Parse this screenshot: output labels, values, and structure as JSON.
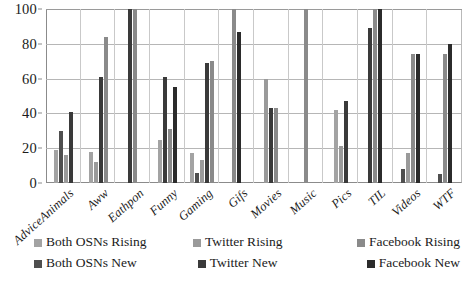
{
  "chart_data": {
    "type": "bar",
    "title": "",
    "subtitle": "",
    "xlabel": "",
    "ylabel": "",
    "ylim": [
      0,
      100
    ],
    "yticks": [
      0,
      20,
      40,
      60,
      80,
      100
    ],
    "grid": true,
    "legend_position": "bottom",
    "categories": [
      "AdviceAnimals",
      "Aww",
      "Eathpon",
      "Funny",
      "Gaming",
      "Gifs",
      "Movies",
      "Music",
      "Pics",
      "TIL",
      "Videos",
      "WTF"
    ],
    "series": [
      {
        "name": "Both OSNs Rising",
        "color": "#a3a3a3",
        "values": [
          19,
          18,
          0,
          25,
          17,
          0,
          0,
          0,
          42,
          0,
          0,
          0
        ]
      },
      {
        "name": "Both OSNs New",
        "color": "#4f4f4f",
        "values": [
          30,
          0,
          0,
          0,
          6,
          0,
          0,
          0,
          0,
          0,
          8,
          5
        ]
      },
      {
        "name": "Twitter Rising",
        "color": "#9a9a9a",
        "values": [
          16,
          12,
          0,
          0,
          13,
          0,
          60,
          0,
          21,
          0,
          17,
          0
        ]
      },
      {
        "name": "Twitter New",
        "color": "#3a3a3a",
        "values": [
          41,
          61,
          100,
          61,
          69,
          0,
          43,
          0,
          47,
          89,
          0,
          0
        ]
      },
      {
        "name": "Facebook Rising",
        "color": "#8a8a8a",
        "values": [
          0,
          84,
          100,
          31,
          70,
          100,
          43,
          100,
          0,
          100,
          74,
          74
        ]
      },
      {
        "name": "Facebook New",
        "color": "#2b2b2b",
        "values": [
          0,
          0,
          0,
          55,
          0,
          87,
          0,
          0,
          0,
          100,
          74,
          80
        ]
      }
    ]
  },
  "legend": {
    "items": [
      "Both OSNs Rising",
      "Twitter Rising",
      "Facebook Rising",
      "Both OSNs New",
      "Twitter New",
      "Facebook New"
    ]
  }
}
